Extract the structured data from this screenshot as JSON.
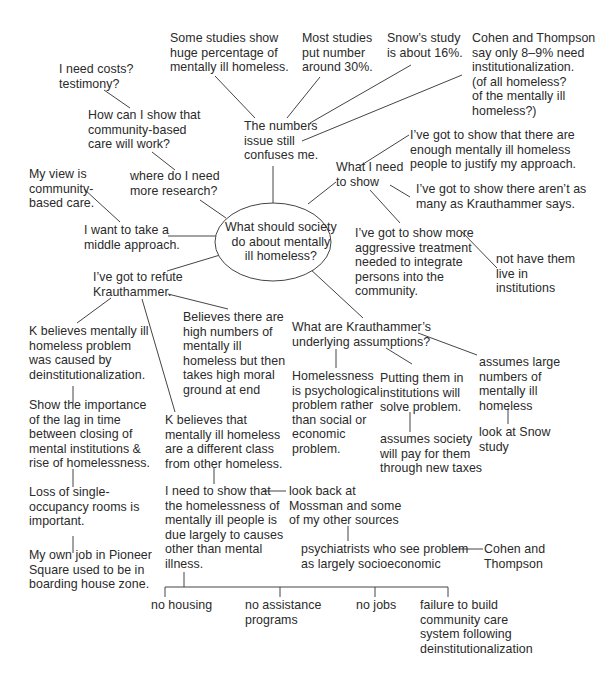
{
  "diagram": {
    "type": "cluster-map",
    "center": {
      "text": "What should society\ndo about mentally\nill homeless?"
    },
    "nodes": {
      "some_studies": "Some studies show\nhuge percentage of\nmentally ill homeless.",
      "most_studies": "Most studies\nput number\naround 30%.",
      "snow_study": "Snow’s study\nis about 16%.",
      "cohen_thompson_top": "Cohen and Thompson\nsay only 8–9% need\ninstitutionalization.\n(of all homeless?\nof the mentally ill\nhomeless?)",
      "need_costs": "I need costs?\ntestimony?",
      "how_show": "How can I show that\ncommunity-based\ncare will work?",
      "numbers_issue": "The numbers\nissue still\nconfuses me.",
      "enough_homeless": "I’ve got to show that there are\nenough mentally ill homeless\npeople to justify my approach.",
      "what_need_show": "What I need\nto show",
      "not_as_many": "I’ve got to show there aren’t as\nmany as Krauthammer says.",
      "my_view": "My view is\ncommunity-\nbased care.",
      "more_research": "where do I need\nmore research?",
      "middle_approach": "I want to take a\nmiddle approach.",
      "aggressive": "I’ve got to show more\naggressive treatment\nneeded to integrate\npersons into the\ncommunity.",
      "not_institutions": "not have them\nlive in\ninstitutions",
      "refute_k": "I’ve got to refute\nKrauthammer.",
      "k_deinst": "K believes mentally ill\nhomeless problem\nwas caused by\ndeinstitutionalization.",
      "believes_high": "Believes there are\nhigh numbers of\nmentally ill\nhomeless but then\ntakes high moral\nground at end",
      "k_assumptions": "What are Krauthammer’s\nunderlying assumptions?",
      "psychological": "Homelessness\nis psychological\nproblem rather\nthan social or\neconomic\nproblem.",
      "putting_institutions": "Putting them in\ninstitutions will\nsolve problem.",
      "assumes_large": "assumes large\nnumbers of\nmentally ill\nhomeless",
      "lag_time": "Show the importance\nof the lag in time\nbetween closing of\nmental institutions &\nrise of homelessness.",
      "k_different_class": "K believes that\nmentally ill homeless\nare a different class\nfrom other homeless.",
      "assumes_society_pay": "assumes society\nwill pay for them\nthrough new taxes",
      "look_snow": "look at Snow\nstudy",
      "single_occupancy": "Loss of single-\noccupancy rooms is\nimportant.",
      "need_show_causes": "I need to show that\nthe homelessness of\nmentally ill people is\ndue largely to causes\nother than mental\nillness.",
      "look_back_mossman": "look back at\nMossman and some\nof my other sources",
      "psychiatrists": "psychiatrists who see problem\nas largely socioeconomic",
      "cohen_thompson_bottom": "Cohen and\nThompson",
      "pioneer_square": "My own job in Pioneer\nSquare used to be in\nboarding house zone.",
      "no_housing": "no housing",
      "no_assistance": "no assistance\nprograms",
      "no_jobs": "no jobs",
      "failure_build": "failure to build\ncommunity care\nsystem following\ndeinstitutionalization"
    },
    "colors": {
      "text": "#2a2a2a",
      "lines": "#444444",
      "background": "#ffffff"
    }
  }
}
